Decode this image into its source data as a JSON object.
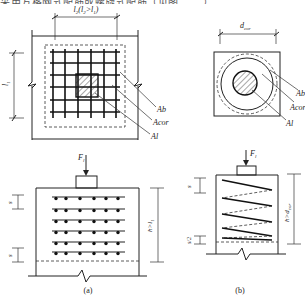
{
  "header": {
    "cropped_caption": "采用方格网式配筋或螺旋式配筋（见图 ……）"
  },
  "figure_a": {
    "plan": {
      "width_dim": "l2(l2>l1)",
      "height_dim": "l1",
      "labels": [
        "Ab",
        "Acor",
        "Al"
      ]
    },
    "elevation": {
      "load": "Fl",
      "spacing_top": "s",
      "spacing_bottom": "s",
      "depth_dim": "h>l1",
      "mesh_rows": 6,
      "bars_per_row": 6
    },
    "caption": "(a)"
  },
  "figure_b": {
    "plan": {
      "diameter_dim": "dcor",
      "labels": [
        "Ab",
        "Acor",
        "Al"
      ]
    },
    "elevation": {
      "load": "Fl",
      "spacing_top": "s",
      "spacing_bottom": "s/2",
      "depth_dim": "h>dcor",
      "spiral_turns": 5
    },
    "caption": "(b)"
  }
}
